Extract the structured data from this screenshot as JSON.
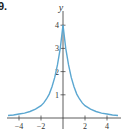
{
  "problem_label": "9.",
  "chart_data": {
    "type": "line",
    "title": "",
    "xlabel": "",
    "ylabel": "y",
    "xlim": [
      -5,
      5
    ],
    "ylim": [
      0,
      4.3
    ],
    "grid": false,
    "xticks": [
      -4,
      -2,
      2,
      4
    ],
    "xtick_labels": [
      "−4",
      "−2",
      "2",
      "4"
    ],
    "yticks": [
      1,
      2,
      3,
      4
    ],
    "ytick_labels": [
      "1",
      "2",
      "3",
      "4"
    ],
    "line_color": "#5ba7d1",
    "series": [
      {
        "name": "curve",
        "x": [
          -5,
          -4.5,
          -4,
          -3.5,
          -3,
          -2.5,
          -2,
          -1.75,
          -1.5,
          -1.25,
          -1,
          -0.75,
          -0.5,
          -0.25,
          0,
          0.25,
          0.5,
          0.75,
          1,
          1.25,
          1.5,
          1.75,
          2,
          2.5,
          3,
          3.5,
          4,
          4.5,
          5
        ],
        "y": [
          0.11,
          0.13,
          0.17,
          0.21,
          0.28,
          0.38,
          0.53,
          0.65,
          0.82,
          1.03,
          1.35,
          1.75,
          2.3,
          3.0,
          4.0,
          3.0,
          2.3,
          1.75,
          1.35,
          1.03,
          0.82,
          0.65,
          0.53,
          0.38,
          0.28,
          0.21,
          0.17,
          0.13,
          0.11
        ]
      }
    ]
  }
}
